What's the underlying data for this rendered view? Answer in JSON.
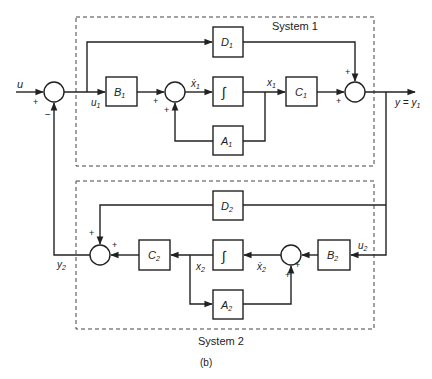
{
  "diagram": {
    "caption": "(b)",
    "systems": [
      {
        "id": "system1",
        "label": "System 1"
      },
      {
        "id": "system2",
        "label": "System 2"
      }
    ],
    "blocks": {
      "B1": {
        "label": "B",
        "sub": "1"
      },
      "C1": {
        "label": "C",
        "sub": "1"
      },
      "D1": {
        "label": "D",
        "sub": "1"
      },
      "A1": {
        "label": "A",
        "sub": "1"
      },
      "int1": {
        "label": "∫"
      },
      "B2": {
        "label": "B",
        "sub": "2"
      },
      "C2": {
        "label": "C",
        "sub": "2"
      },
      "D2": {
        "label": "D",
        "sub": "2"
      },
      "A2": {
        "label": "A",
        "sub": "2"
      },
      "int2": {
        "label": "∫"
      }
    },
    "signals": {
      "u": "u",
      "u1": {
        "label": "u",
        "sub": "1"
      },
      "x1dot": {
        "label": "ẋ",
        "sub": "1"
      },
      "x1": {
        "label": "x",
        "sub": "1"
      },
      "y": "y = y",
      "y_sub": "1",
      "u2": {
        "label": "u",
        "sub": "2"
      },
      "x2dot": {
        "label": "ẋ",
        "sub": "2"
      },
      "x2": {
        "label": "x",
        "sub": "2"
      },
      "y2": {
        "label": "y",
        "sub": "2"
      }
    },
    "signs": {
      "plus": "+",
      "minus": "−"
    }
  }
}
